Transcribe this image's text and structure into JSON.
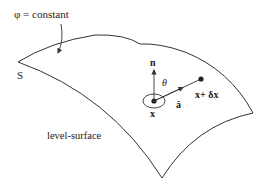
{
  "diagram": {
    "title_label": "φ = constant",
    "corner_label": "S",
    "surface_label": "level-surface",
    "normal_label": "n",
    "angle_label": "θ",
    "direction_label": "â",
    "point_label": "x",
    "displaced_point_label": "x+ δx",
    "colors": {
      "stroke": "#333333",
      "background": "#ffffff"
    }
  }
}
